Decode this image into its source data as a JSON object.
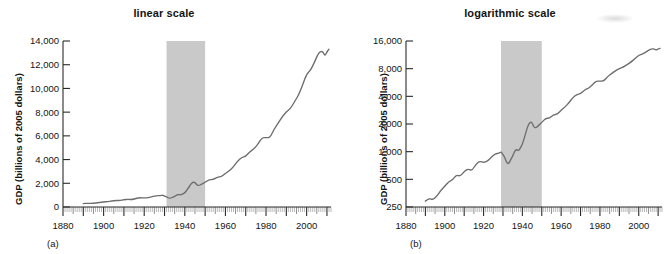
{
  "figure": {
    "background": "#ffffff",
    "line_color": "#6d6d6d",
    "band_color": "#c9c9c9",
    "axis_color": "#2b2b2b"
  },
  "chart_data": [
    {
      "type": "line",
      "id": "linear",
      "title": "linear scale",
      "panel_label": "(a)",
      "xlabel": "",
      "ylabel": "GDP (billions of 2005 dollars)",
      "yscale": "linear",
      "xlim": [
        1880,
        2012
      ],
      "ylim": [
        0,
        14000
      ],
      "yticks": [
        0,
        2000,
        4000,
        6000,
        8000,
        10000,
        12000,
        14000
      ],
      "ytick_labels": [
        "0",
        "2,000",
        "4,000",
        "6,000",
        "8,000",
        "10,000",
        "12,000",
        "14,000"
      ],
      "xticks": [
        1880,
        1900,
        1920,
        1940,
        1960,
        1980,
        2000
      ],
      "xtick_labels": [
        "1880",
        "1900",
        "1920",
        "1940",
        "1960",
        "1980",
        "2000"
      ],
      "grid": false,
      "legend": "none",
      "shaded_band": {
        "label": "",
        "x_start": 1931,
        "x_end": 1950
      },
      "series": [
        {
          "name": "U.S. real GDP",
          "x": [
            1890,
            1892,
            1894,
            1896,
            1898,
            1900,
            1902,
            1904,
            1906,
            1908,
            1910,
            1912,
            1914,
            1916,
            1918,
            1920,
            1922,
            1924,
            1926,
            1928,
            1929,
            1930,
            1931,
            1932,
            1933,
            1934,
            1935,
            1936,
            1937,
            1938,
            1939,
            1940,
            1941,
            1942,
            1943,
            1944,
            1945,
            1946,
            1947,
            1948,
            1950,
            1952,
            1954,
            1956,
            1958,
            1960,
            1962,
            1964,
            1966,
            1968,
            1970,
            1972,
            1974,
            1976,
            1978,
            1980,
            1982,
            1984,
            1986,
            1988,
            1990,
            1992,
            1994,
            1996,
            1998,
            2000,
            2002,
            2004,
            2006,
            2008,
            2009,
            2010,
            2011
          ],
          "y": [
            290,
            310,
            300,
            330,
            380,
            420,
            470,
            490,
            560,
            540,
            610,
            650,
            620,
            730,
            790,
            760,
            790,
            870,
            950,
            960,
            1000,
            930,
            860,
            750,
            740,
            820,
            890,
            1010,
            1060,
            1020,
            1100,
            1200,
            1410,
            1670,
            1950,
            2100,
            2080,
            1840,
            1820,
            1890,
            2080,
            2310,
            2310,
            2520,
            2550,
            2830,
            3070,
            3400,
            3870,
            4190,
            4270,
            4670,
            4890,
            5300,
            5870,
            5840,
            5870,
            6580,
            7070,
            7610,
            8030,
            8290,
            8870,
            9430,
            10280,
            11220,
            11540,
            12260,
            13060,
            13160,
            12700,
            13090,
            13310
          ]
        }
      ]
    },
    {
      "type": "line",
      "id": "logarithmic",
      "title": "logarithmic scale",
      "panel_label": "(b)",
      "xlabel": "",
      "ylabel": "GDP (billions of 2005 dollars)",
      "yscale": "log",
      "xlim": [
        1880,
        2012
      ],
      "ylim": [
        250,
        16000
      ],
      "yticks": [
        250,
        500,
        1000,
        2000,
        4000,
        8000,
        16000
      ],
      "ytick_labels": [
        "250",
        "500",
        "1,000",
        "2,000",
        "4,000",
        "8,000",
        "16,000"
      ],
      "xticks": [
        1880,
        1900,
        1920,
        1940,
        1960,
        1980,
        2000
      ],
      "xtick_labels": [
        "1880",
        "1900",
        "1920",
        "1940",
        "1960",
        "1980",
        "2000"
      ],
      "grid": false,
      "legend": "none",
      "shaded_band": {
        "label": "",
        "x_start": 1929,
        "x_end": 1950
      },
      "series": [
        {
          "name": "U.S. real GDP",
          "x": [
            1890,
            1892,
            1894,
            1896,
            1898,
            1900,
            1902,
            1904,
            1906,
            1908,
            1910,
            1912,
            1914,
            1916,
            1918,
            1920,
            1922,
            1924,
            1926,
            1928,
            1929,
            1930,
            1931,
            1932,
            1933,
            1934,
            1935,
            1936,
            1937,
            1938,
            1939,
            1940,
            1941,
            1942,
            1943,
            1944,
            1945,
            1946,
            1947,
            1948,
            1950,
            1952,
            1954,
            1956,
            1958,
            1960,
            1962,
            1964,
            1966,
            1968,
            1970,
            1972,
            1974,
            1976,
            1978,
            1980,
            1982,
            1984,
            1986,
            1988,
            1990,
            1992,
            1994,
            1996,
            1998,
            2000,
            2002,
            2004,
            2006,
            2008,
            2009,
            2010,
            2011
          ],
          "y": [
            290,
            310,
            300,
            330,
            380,
            420,
            470,
            490,
            560,
            540,
            610,
            650,
            620,
            730,
            790,
            760,
            790,
            870,
            950,
            960,
            1000,
            930,
            860,
            750,
            740,
            820,
            890,
            1010,
            1060,
            1020,
            1100,
            1200,
            1410,
            1670,
            1950,
            2100,
            2080,
            1840,
            1820,
            1890,
            2080,
            2310,
            2310,
            2520,
            2550,
            2830,
            3070,
            3400,
            3870,
            4190,
            4270,
            4670,
            4890,
            5300,
            5870,
            5840,
            5870,
            6580,
            7070,
            7610,
            8030,
            8290,
            8870,
            9430,
            10280,
            11220,
            11540,
            12260,
            13060,
            13160,
            12700,
            13090,
            13310
          ]
        }
      ]
    }
  ]
}
